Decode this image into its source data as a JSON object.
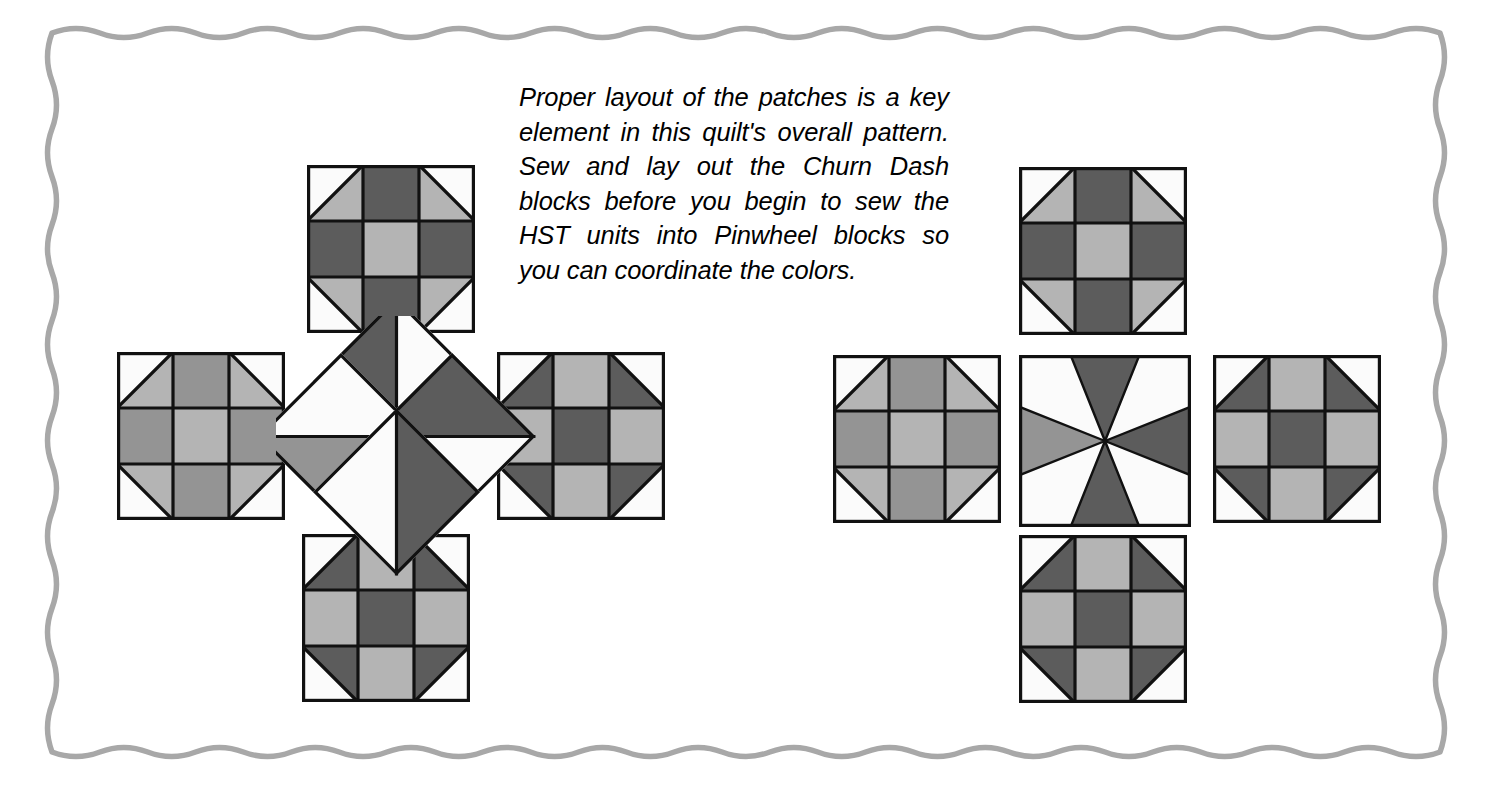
{
  "page": {
    "background": "#ffffff",
    "width": 1487,
    "height": 790
  },
  "border": {
    "style": "wavy-scalloped-line",
    "color": "#a8a8a8",
    "stroke_width": 5.5,
    "wave_period": 48,
    "wave_amplitude": 9
  },
  "caption": {
    "full_text": "Proper layout of the patches is a key element in this quilt's overall pattern. Sew and lay out the Churn Dash blocks before you begin to sew the HST units into Pinwheel blocks so you can coordinate the colors.",
    "lines": [
      "Proper layout of the patches is a key",
      "element in this quilt's overall pattern.",
      "Sew and lay out the Churn Dash",
      "blocks before you begin to sew the",
      "HST units into Pinwheel blocks so",
      "you can coordinate the colors."
    ],
    "style": "italic",
    "color": "#000000"
  },
  "palette": {
    "white": "#fbfbfb",
    "light_gray": "#b4b4b4",
    "medium_gray": "#949494",
    "dark_gray": "#5c5c5c",
    "outline": "#111111",
    "border_gray": "#a8a8a8"
  },
  "diagram": {
    "clusters": [
      {
        "name": "left-cluster",
        "description": "Four Churn Dash blocks around an exploded Pinwheel made of four separate HST units set on point",
        "center_type": "hst-units-exploded",
        "blocks": [
          {
            "position": "top",
            "type": "churn-dash",
            "variant": "dark-cross-light-center"
          },
          {
            "position": "left",
            "type": "churn-dash",
            "variant": "medium-cross-light-center"
          },
          {
            "position": "right",
            "type": "churn-dash",
            "variant": "dark-corners-dark-center"
          },
          {
            "position": "bottom",
            "type": "churn-dash",
            "variant": "dark-corners-dark-center"
          }
        ],
        "center_units": [
          {
            "position": "top",
            "type": "hst",
            "light": "#fbfbfb",
            "dark": "#5c5c5c"
          },
          {
            "position": "left",
            "type": "hst",
            "light": "#fbfbfb",
            "dark": "#949494"
          },
          {
            "position": "right",
            "type": "hst",
            "light": "#fbfbfb",
            "dark": "#5c5c5c"
          },
          {
            "position": "bottom",
            "type": "hst",
            "light": "#fbfbfb",
            "dark": "#5c5c5c"
          }
        ]
      },
      {
        "name": "right-cluster",
        "description": "Four Churn Dash blocks around a fully assembled Pinwheel block",
        "center_type": "pinwheel-block-assembled",
        "blocks": [
          {
            "position": "top",
            "type": "churn-dash",
            "variant": "dark-cross-light-center"
          },
          {
            "position": "left",
            "type": "churn-dash",
            "variant": "medium-cross-light-center"
          },
          {
            "position": "right",
            "type": "churn-dash",
            "variant": "dark-corners-dark-center"
          },
          {
            "position": "bottom",
            "type": "churn-dash",
            "variant": "dark-corners-dark-center"
          }
        ],
        "center_block": {
          "type": "pinwheel",
          "blades": [
            {
              "position": "top",
              "color": "#5c5c5c"
            },
            {
              "position": "right",
              "color": "#5c5c5c"
            },
            {
              "position": "bottom",
              "color": "#5c5c5c"
            },
            {
              "position": "left",
              "color": "#949494"
            }
          ],
          "background": "#fbfbfb"
        }
      }
    ]
  }
}
